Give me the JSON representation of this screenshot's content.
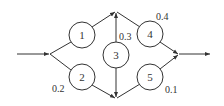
{
  "diagram": {
    "type": "reliability-network",
    "nodes": [
      {
        "id": "1",
        "label": "1",
        "probability": ""
      },
      {
        "id": "2",
        "label": "2",
        "probability": "0.2"
      },
      {
        "id": "3",
        "label": "3",
        "probability": "0.3"
      },
      {
        "id": "4",
        "label": "4",
        "probability": "0.4"
      },
      {
        "id": "5",
        "label": "5",
        "probability": "0.1"
      }
    ],
    "edges": [
      {
        "from": "input",
        "to": "split"
      },
      {
        "from": "split",
        "to": "1"
      },
      {
        "from": "split",
        "to": "2"
      },
      {
        "from": "1",
        "to": "top-junction"
      },
      {
        "from": "2",
        "to": "bottom-junction"
      },
      {
        "from": "3",
        "to": "top-junction"
      },
      {
        "from": "3",
        "to": "bottom-junction"
      },
      {
        "from": "top-junction",
        "to": "4"
      },
      {
        "from": "bottom-junction",
        "to": "5"
      },
      {
        "from": "4",
        "to": "merge"
      },
      {
        "from": "5",
        "to": "merge"
      },
      {
        "from": "merge",
        "to": "output"
      }
    ]
  }
}
